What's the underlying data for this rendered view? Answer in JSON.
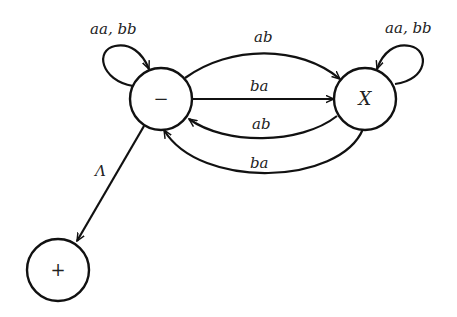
{
  "diagram": {
    "type": "finite-automaton",
    "nodes": [
      {
        "id": "start",
        "label": "−",
        "role": "start state"
      },
      {
        "id": "X",
        "label": "X",
        "role": "intermediate state"
      },
      {
        "id": "final",
        "label": "+",
        "role": "final state"
      }
    ],
    "edges": [
      {
        "from": "start",
        "to": "start",
        "label": "aa, bb"
      },
      {
        "from": "X",
        "to": "X",
        "label": "aa, bb"
      },
      {
        "from": "start",
        "to": "X",
        "label": "ab"
      },
      {
        "from": "start",
        "to": "X",
        "label": "ba"
      },
      {
        "from": "X",
        "to": "start",
        "label": "ab"
      },
      {
        "from": "X",
        "to": "start",
        "label": "ba"
      },
      {
        "from": "start",
        "to": "final",
        "label": "Λ"
      }
    ]
  },
  "colors": {
    "stroke": "#111111",
    "background": "#ffffff"
  }
}
